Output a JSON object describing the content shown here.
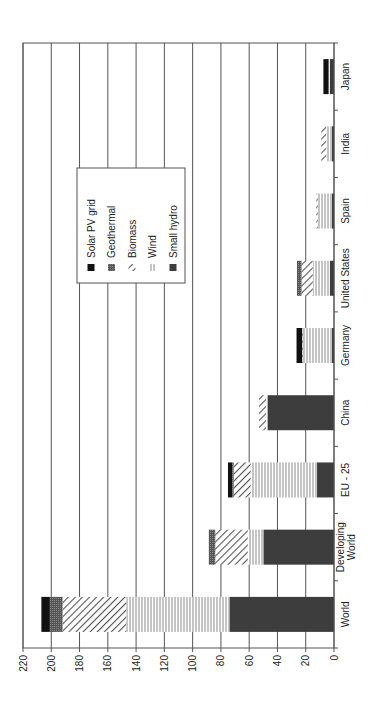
{
  "chart_data": {
    "type": "bar",
    "orientation": "stacked bars, figure rotated 90° counter-clockwise",
    "title": "",
    "xlabel": "",
    "ylabel": "",
    "ylim": [
      0,
      220
    ],
    "yticks": [
      0,
      20,
      40,
      60,
      80,
      100,
      120,
      140,
      160,
      180,
      200,
      220
    ],
    "grid": true,
    "legend_position": "inside, upper area",
    "categories": [
      "World",
      "Developing World",
      "EU - 25",
      "China",
      "Germany",
      "United States",
      "Spain",
      "India",
      "Japan"
    ],
    "category_label_lines": [
      [
        "World"
      ],
      [
        "Developing",
        "World"
      ],
      [
        "EU - 25"
      ],
      [
        "China"
      ],
      [
        "Germany"
      ],
      [
        "United States"
      ],
      [
        "Spain"
      ],
      [
        "India"
      ],
      [
        "Japan"
      ]
    ],
    "series": [
      {
        "name": "Small hydro",
        "pattern": "solid-dark",
        "color": "#3a3a3a",
        "values": [
          74,
          50,
          12,
          47,
          1.5,
          3,
          1.5,
          1.5,
          3
        ]
      },
      {
        "name": "Wind",
        "pattern": "vertical-lines",
        "color": "#9a9a9a",
        "values": [
          73,
          11,
          47,
          1,
          20.5,
          12,
          10,
          4,
          0.5
        ]
      },
      {
        "name": "Biomass",
        "pattern": "diagonal-hatch",
        "color": "#555555",
        "values": [
          45,
          23,
          12,
          5,
          0.5,
          8,
          1,
          3.5,
          0
        ]
      },
      {
        "name": "Geothermal",
        "pattern": "dense-grid",
        "color": "#4a4a4a",
        "values": [
          9,
          4,
          1,
          0,
          0,
          2.5,
          0,
          0,
          0.5
        ]
      },
      {
        "name": "Solar PV grid",
        "pattern": "solid-black",
        "color": "#111111",
        "values": [
          6,
          0.5,
          3,
          0,
          4,
          0.5,
          0,
          0,
          3.5
        ]
      }
    ],
    "totals": [
      207,
      88.5,
      75,
      53,
      26,
      26,
      12.5,
      9,
      7.5
    ]
  },
  "legend": {
    "items": [
      {
        "label": "Solar PV grid",
        "key": "solar"
      },
      {
        "label": "Geothermal",
        "key": "geo"
      },
      {
        "label": "Biomass",
        "key": "bio"
      },
      {
        "label": "Wind",
        "key": "wind"
      },
      {
        "label": "Small hydro",
        "key": "hydro"
      }
    ]
  }
}
